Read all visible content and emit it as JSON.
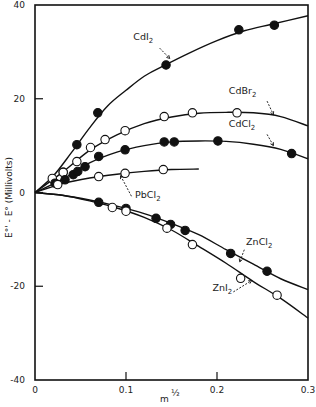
{
  "chart_data": {
    "type": "line",
    "title": "",
    "xlabel": "m^1/2",
    "ylabel": "E°' - E° (Millivolts)",
    "xlim": [
      0,
      0.3
    ],
    "ylim": [
      -40,
      40
    ],
    "xticks": [
      0,
      0.1,
      0.2,
      0.3
    ],
    "xtick_labels": [
      "0",
      "0.1",
      "0.2",
      "0.3"
    ],
    "yticks": [
      -40,
      -20,
      0,
      20,
      40
    ],
    "ytick_labels": [
      "-40",
      "-20",
      "0",
      "20",
      "40"
    ],
    "grid": false,
    "legend": "inline labels with arrows",
    "series": [
      {
        "name": "CdI2",
        "marker": "filled",
        "points": [
          [
            0.031,
            4.3
          ],
          [
            0.046,
            10.2
          ],
          [
            0.069,
            17.0
          ],
          [
            0.144,
            27.2
          ],
          [
            0.224,
            34.7
          ],
          [
            0.263,
            35.7
          ]
        ],
        "curve": [
          [
            0,
            0
          ],
          [
            0.02,
            3.5
          ],
          [
            0.04,
            8.5
          ],
          [
            0.06,
            13.8
          ],
          [
            0.08,
            18.5
          ],
          [
            0.1,
            21.8
          ],
          [
            0.12,
            24.8
          ],
          [
            0.14,
            26.9
          ],
          [
            0.17,
            29.8
          ],
          [
            0.2,
            32.4
          ],
          [
            0.23,
            34.5
          ],
          [
            0.26,
            35.9
          ],
          [
            0.3,
            37.7
          ]
        ]
      },
      {
        "name": "CdBr2",
        "marker": "open",
        "points": [
          [
            0.019,
            3.0
          ],
          [
            0.031,
            4.3
          ],
          [
            0.046,
            6.6
          ],
          [
            0.061,
            9.6
          ],
          [
            0.077,
            11.3
          ],
          [
            0.099,
            13.2
          ],
          [
            0.142,
            16.2
          ],
          [
            0.173,
            17.0
          ],
          [
            0.222,
            17.0
          ]
        ],
        "curve": [
          [
            0,
            0
          ],
          [
            0.03,
            4.3
          ],
          [
            0.06,
            9.0
          ],
          [
            0.09,
            12.3
          ],
          [
            0.12,
            14.7
          ],
          [
            0.15,
            16.1
          ],
          [
            0.18,
            16.9
          ],
          [
            0.21,
            17.1
          ],
          [
            0.24,
            17.0
          ],
          [
            0.27,
            16.2
          ],
          [
            0.3,
            14.2
          ]
        ]
      },
      {
        "name": "CdCl2",
        "marker": "filled",
        "points": [
          [
            0.022,
            2.0
          ],
          [
            0.033,
            2.7
          ],
          [
            0.042,
            3.8
          ],
          [
            0.047,
            4.5
          ],
          [
            0.055,
            5.5
          ],
          [
            0.07,
            7.7
          ],
          [
            0.099,
            9.1
          ],
          [
            0.142,
            10.8
          ],
          [
            0.153,
            10.8
          ],
          [
            0.201,
            11.0
          ],
          [
            0.282,
            8.3
          ]
        ],
        "curve": [
          [
            0,
            0
          ],
          [
            0.03,
            2.8
          ],
          [
            0.06,
            6.3
          ],
          [
            0.09,
            8.6
          ],
          [
            0.12,
            10.0
          ],
          [
            0.15,
            10.8
          ],
          [
            0.18,
            11.0
          ],
          [
            0.21,
            10.9
          ],
          [
            0.24,
            10.3
          ],
          [
            0.27,
            9.2
          ],
          [
            0.3,
            7.2
          ]
        ]
      },
      {
        "name": "PbCl2",
        "marker": "open",
        "points": [
          [
            0.025,
            1.7
          ],
          [
            0.07,
            3.4
          ],
          [
            0.099,
            4.1
          ],
          [
            0.141,
            4.9
          ]
        ],
        "curve": [
          [
            0,
            0
          ],
          [
            0.03,
            1.9
          ],
          [
            0.06,
            3.1
          ],
          [
            0.09,
            3.9
          ],
          [
            0.12,
            4.5
          ],
          [
            0.15,
            4.9
          ],
          [
            0.18,
            5.0
          ]
        ]
      },
      {
        "name": "ZnCl2",
        "marker": "filled",
        "points": [
          [
            0.07,
            -2.1
          ],
          [
            0.1,
            -3.4
          ],
          [
            0.133,
            -5.5
          ],
          [
            0.149,
            -6.8
          ],
          [
            0.165,
            -8.1
          ],
          [
            0.215,
            -13.0
          ],
          [
            0.255,
            -16.8
          ]
        ],
        "curve": [
          [
            0,
            0
          ],
          [
            0.03,
            -0.6
          ],
          [
            0.06,
            -1.6
          ],
          [
            0.09,
            -2.9
          ],
          [
            0.12,
            -4.5
          ],
          [
            0.15,
            -6.6
          ],
          [
            0.18,
            -9.0
          ],
          [
            0.21,
            -12.2
          ],
          [
            0.24,
            -15.3
          ],
          [
            0.27,
            -18.4
          ],
          [
            0.3,
            -20.7
          ]
        ]
      },
      {
        "name": "ZnI2",
        "marker": "open",
        "points": [
          [
            0.085,
            -3.2
          ],
          [
            0.1,
            -4.0
          ],
          [
            0.145,
            -7.6
          ],
          [
            0.173,
            -11.1
          ],
          [
            0.226,
            -18.3
          ],
          [
            0.266,
            -21.9
          ]
        ],
        "curve": [
          [
            0,
            0
          ],
          [
            0.03,
            -0.6
          ],
          [
            0.06,
            -1.8
          ],
          [
            0.09,
            -3.3
          ],
          [
            0.12,
            -5.3
          ],
          [
            0.15,
            -8.0
          ],
          [
            0.18,
            -11.5
          ],
          [
            0.21,
            -15.1
          ],
          [
            0.24,
            -19.0
          ],
          [
            0.27,
            -22.6
          ],
          [
            0.3,
            -26.8
          ]
        ]
      }
    ],
    "annotations": [
      {
        "text": "CdI2",
        "x": 0.108,
        "y": 32.5
      },
      {
        "text": "CdBr2",
        "x": 0.213,
        "y": 21.0
      },
      {
        "text": "CdCl2",
        "x": 0.213,
        "y": 14.0
      },
      {
        "text": "PbCl2",
        "x": 0.11,
        "y": -1.2
      },
      {
        "text": "ZnCl2",
        "x": 0.232,
        "y": -11.3
      },
      {
        "text": "ZnI2",
        "x": 0.195,
        "y": -21.0
      }
    ]
  }
}
